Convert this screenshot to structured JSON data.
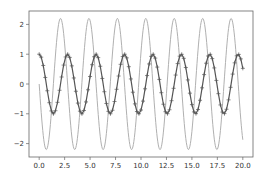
{
  "chart_data": {
    "type": "line",
    "title": "",
    "xlabel": "",
    "ylabel": "",
    "xlim": [
      -1.0,
      21.0
    ],
    "ylim": [
      -2.45,
      2.45
    ],
    "grid": false,
    "legend": null,
    "x_ticks": [
      0.0,
      2.5,
      5.0,
      7.5,
      10.0,
      12.5,
      15.0,
      17.5,
      20.0
    ],
    "x_tick_labels": [
      "0.0",
      "2.5",
      "5.0",
      "7.5",
      "10.0",
      "12.5",
      "15.0",
      "17.5",
      "20.0"
    ],
    "y_ticks": [
      2,
      1,
      0,
      -1,
      -2
    ],
    "y_tick_labels": [
      "2",
      "1",
      "0",
      "−1",
      "−2"
    ],
    "series": [
      {
        "name": "position",
        "description": "cosine wave, amplitude 1, starts at 1",
        "formula": "y = cos(2.25 x)",
        "x_range": [
          0,
          20
        ],
        "step": 0.2,
        "color": "#555555",
        "marker": "+",
        "linewidth": 1.2
      },
      {
        "name": "velocity",
        "description": "negative sine wave, amplitude ~2.2, starts at 0, ends near -1.5",
        "formula": "y = -2.2 sin(2.25 x)",
        "x_range": [
          0,
          20
        ],
        "step": 0.05,
        "color": "#b0b0b0",
        "marker": "",
        "linewidth": 1.0
      }
    ]
  },
  "plot_area": {
    "left": 29,
    "top": 11,
    "right": 253,
    "bottom": 157
  },
  "colors": {
    "axes": "#555555",
    "text": "#333333",
    "background": "#ffffff"
  }
}
